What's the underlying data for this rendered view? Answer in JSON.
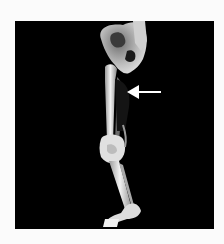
{
  "image": {
    "subject": "3D CT reconstruction of lower limb skeleton (pelvis, femur, tibia/fibula, foot)",
    "background_color": "#000000",
    "page_color": "#fbfbfb",
    "bone_color": "#e8e8e8",
    "annotation": {
      "type": "arrow",
      "direction": "left",
      "color": "#ffffff",
      "points_to": "mid-thigh soft tissue region"
    }
  }
}
